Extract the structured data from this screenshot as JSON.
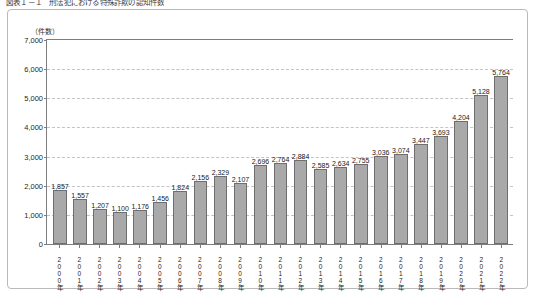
{
  "figure": {
    "caption": "図表１－１　刑法犯における特殊詐欺の認知件数",
    "unit_label": "（件数）"
  },
  "chart_data": {
    "type": "bar",
    "title": "図表１－１　刑法犯における特殊詐欺の認知件数",
    "xlabel": "",
    "ylabel": "（件数）",
    "ylim": [
      0,
      7000
    ],
    "ytick_values": [
      0,
      1000,
      2000,
      3000,
      4000,
      5000,
      6000,
      7000
    ],
    "ytick_labels": [
      "0",
      "1,000",
      "2,000",
      "3,000",
      "4,000",
      "5,000",
      "6,000",
      "7,000"
    ],
    "grid": true,
    "legend": null,
    "bar_color": "#a9a9a9",
    "bar_border_color": "#6e6e6e",
    "categories": [
      "2000年",
      "2001年",
      "2002年",
      "2003年",
      "2004年",
      "2005年",
      "2006年",
      "2007年",
      "2008年",
      "2009年",
      "2010年",
      "2011年",
      "2012年",
      "2013年",
      "2014年",
      "2015年",
      "2016年",
      "2017年",
      "2018年",
      "2019年",
      "2020年",
      "2021年",
      "2022年"
    ],
    "values": [
      1857,
      1557,
      1207,
      1100,
      1176,
      1456,
      1824,
      2156,
      2329,
      2107,
      2696,
      2764,
      2884,
      2585,
      2634,
      2755,
      3036,
      3074,
      3447,
      3693,
      4204,
      5128,
      5764
    ],
    "value_labels": [
      "1,857",
      "1,557",
      "1,207",
      "1,100",
      "1,176",
      "1,456",
      "1,824",
      "2,156",
      "2,329",
      "2,107",
      "2,696",
      "2,764",
      "2,884",
      "2,585",
      "2,634",
      "2,755",
      "3,036",
      "3,074",
      "3,447",
      "3,693",
      "4,204",
      "5,128",
      "5,764"
    ]
  }
}
